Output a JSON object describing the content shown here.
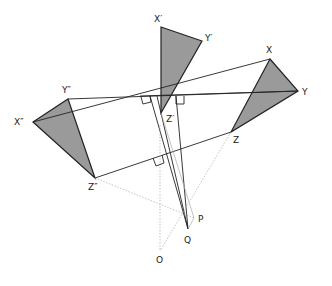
{
  "diagram": {
    "colors": {
      "fill": "#9a9a9a",
      "stroke": "#222222",
      "dotted": "#999999"
    },
    "labels": {
      "X1": "X′",
      "Y1": "Y′",
      "Z1": "Z′",
      "X": "X",
      "Y": "Y",
      "Z": "Z",
      "X2": "X″",
      "Y2": "Y″",
      "Z2": "Z″",
      "P": "P",
      "Q": "Q",
      "O": "O"
    },
    "points": {
      "X1": [
        161,
        27
      ],
      "Y1": [
        202,
        41
      ],
      "Z1": [
        161,
        113
      ],
      "X": [
        270,
        59
      ],
      "Y": [
        298,
        91
      ],
      "Z": [
        231,
        132
      ],
      "X2": [
        33,
        122
      ],
      "Y2": [
        68,
        99
      ],
      "Z2": [
        95,
        178
      ],
      "P": [
        194,
        218
      ],
      "Q": [
        188,
        229
      ],
      "O": [
        160,
        251
      ]
    },
    "triangles": [
      {
        "name": "triangle-x1y1z1",
        "vertices": [
          "X1",
          "Y1",
          "Z1"
        ]
      },
      {
        "name": "triangle-xyz",
        "vertices": [
          "X",
          "Y",
          "Z"
        ]
      },
      {
        "name": "triangle-x2y2z2",
        "vertices": [
          "X2",
          "Y2",
          "Z2"
        ]
      }
    ],
    "right_angle_marks": 3
  }
}
